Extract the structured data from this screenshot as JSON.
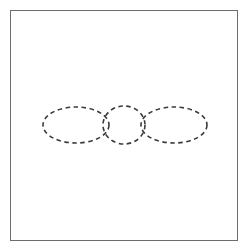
{
  "canvas": {
    "width": 248,
    "height": 251,
    "background_color": "#ffffff"
  },
  "frame": {
    "name": "outer-frame",
    "x": 10,
    "y": 10,
    "width": 228,
    "height": 231,
    "border_color": "#6d6d6d",
    "border_width": 1,
    "fill_color": "#ffffff"
  },
  "diagram": {
    "title": "",
    "stroke_color": "#3a3a3a",
    "stroke_width": 1.6,
    "dash_pattern": "4.5 3.5",
    "shapes": [
      {
        "name": "left-ellipse",
        "type": "ellipse",
        "cx": 76,
        "cy": 125,
        "rx": 33,
        "ry": 18
      },
      {
        "name": "middle-circle",
        "type": "circle",
        "cx": 124,
        "cy": 125,
        "rx": 21,
        "ry": 19
      },
      {
        "name": "right-ellipse",
        "type": "ellipse",
        "cx": 174,
        "cy": 125,
        "rx": 33,
        "ry": 18
      }
    ]
  }
}
